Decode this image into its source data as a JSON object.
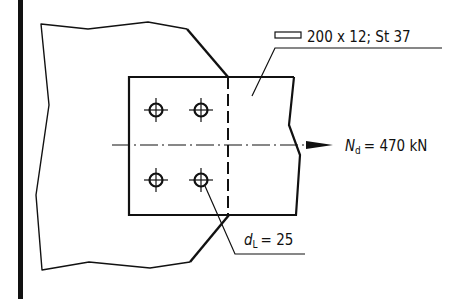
{
  "diagram": {
    "type": "steel-connection-drawing",
    "colors": {
      "line": "#111111",
      "background": "#ffffff"
    },
    "plate_label": {
      "symbol": "flat-bar-section-icon",
      "text": "200 x 12; St 37"
    },
    "force_label": {
      "symbol": "N",
      "subscript": "d",
      "text": "= 470 kN"
    },
    "bolt_label": {
      "symbol": "d",
      "subscript": "L",
      "text": "= 25"
    },
    "bolts": [
      {
        "x": 156,
        "y": 110
      },
      {
        "x": 201,
        "y": 110
      },
      {
        "x": 156,
        "y": 180
      },
      {
        "x": 201,
        "y": 180
      }
    ]
  }
}
